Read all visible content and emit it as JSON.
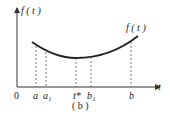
{
  "diagram": {
    "y_axis_label": "f ( t )",
    "curve_label": "f ( t )",
    "x_axis_label": "t",
    "origin_label": "0",
    "ticks": [
      {
        "label": "a",
        "x": 36
      },
      {
        "label": "a₁",
        "x": 46
      },
      {
        "label": "t*",
        "x": 76
      },
      {
        "label": "b₁",
        "x": 91
      },
      {
        "label": "b",
        "x": 131
      }
    ],
    "caption": "( b )",
    "colors": {
      "curve": "#222222",
      "axis": "#333333",
      "dashed": "#555555"
    }
  }
}
